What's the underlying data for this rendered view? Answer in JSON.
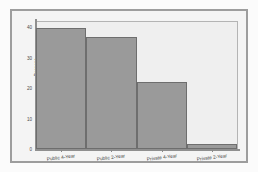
{
  "chart_data": {
    "type": "bar",
    "title": "",
    "subtitle": "",
    "xlabel": "",
    "ylabel": "Percent",
    "categories": [
      "Public 4-Year",
      "Public 2-Year",
      "Private 4-Year",
      "Private 2-Year"
    ],
    "values": [
      40,
      37,
      22,
      1.5
    ],
    "ylim": [
      0,
      42
    ],
    "yticks": [
      0,
      10,
      20,
      30,
      40
    ],
    "ytick_labels": [
      "0",
      "10",
      "20",
      "30",
      "40"
    ],
    "grid": false,
    "legend": false,
    "legend_position": "none",
    "bar_color": "#9a9a9a",
    "bar_edge_color": "#6e6e6e",
    "plot_background": "#efefef",
    "frame_color": "#9d9d9d",
    "axis_color": "#8f8f8f",
    "figure_background": "#f4f4f4",
    "page_background": "#fbfbfb"
  }
}
